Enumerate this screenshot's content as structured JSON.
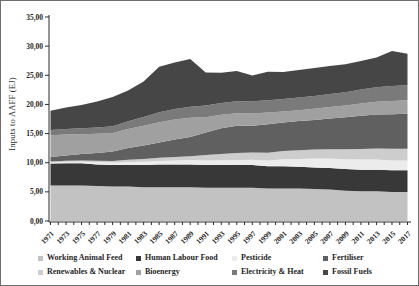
{
  "chart_data": {
    "type": "area",
    "stacked": true,
    "title": "",
    "ylabel": "Inputs to AAFF (EJ)",
    "ylim": [
      0,
      35
    ],
    "ytick_step": 5,
    "ytick_labels": [
      "0,00",
      "5,00",
      "10,00",
      "15,00",
      "20,00",
      "25,00",
      "30,00",
      "35,00"
    ],
    "decimal_style": "comma",
    "grid": false,
    "legend_position": "bottom",
    "x": [
      1971,
      1973,
      1975,
      1977,
      1979,
      1981,
      1983,
      1985,
      1987,
      1989,
      1991,
      1993,
      1995,
      1997,
      1999,
      2001,
      2003,
      2005,
      2007,
      2009,
      2011,
      2013,
      2015,
      2017
    ],
    "x_tick_labels": [
      "1971",
      "1973",
      "1975",
      "1977",
      "1979",
      "1981",
      "1983",
      "1985",
      "1987",
      "1989",
      "1991",
      "1993",
      "1995",
      "1997",
      "1999",
      "2001",
      "2003",
      "2005",
      "2007",
      "2009",
      "2011",
      "2013",
      "2015",
      "2017"
    ],
    "series": [
      {
        "name": "Working Animal Feed",
        "color": "#c2c2c2",
        "values": [
          6.1,
          6.1,
          6.1,
          6.0,
          5.9,
          5.9,
          5.8,
          5.8,
          5.8,
          5.8,
          5.7,
          5.7,
          5.7,
          5.7,
          5.6,
          5.6,
          5.6,
          5.5,
          5.4,
          5.2,
          5.1,
          5.1,
          5.0,
          5.0
        ]
      },
      {
        "name": "Human Labour Food",
        "color": "#383838",
        "values": [
          3.75,
          3.8,
          3.8,
          3.7,
          3.7,
          3.7,
          3.8,
          3.9,
          3.9,
          3.9,
          3.9,
          3.9,
          3.9,
          3.9,
          3.8,
          3.8,
          3.7,
          3.7,
          3.7,
          3.7,
          3.7,
          3.7,
          3.7,
          3.7
        ]
      },
      {
        "name": "Pesticide",
        "color": "#ececec",
        "values": [
          0.2,
          0.25,
          0.3,
          0.4,
          0.45,
          0.5,
          0.55,
          0.6,
          0.7,
          0.75,
          0.8,
          0.82,
          0.85,
          0.9,
          1.0,
          1.2,
          1.35,
          1.5,
          1.6,
          1.7,
          1.75,
          1.75,
          1.7,
          1.7
        ]
      },
      {
        "name": "Renewables & Nuclear",
        "color": "#cdcdcd",
        "values": [
          0.15,
          0.17,
          0.2,
          0.22,
          0.25,
          0.4,
          0.5,
          0.55,
          0.6,
          0.65,
          0.9,
          1.1,
          1.2,
          1.25,
          1.3,
          1.4,
          1.5,
          1.55,
          1.6,
          1.7,
          1.8,
          1.9,
          2.0,
          2.0
        ]
      },
      {
        "name": "Fertiliser",
        "color": "#606060",
        "values": [
          0.8,
          0.9,
          1.1,
          1.35,
          1.6,
          2.0,
          2.3,
          2.6,
          3.0,
          3.3,
          3.9,
          4.4,
          4.7,
          4.6,
          4.9,
          4.9,
          5.0,
          5.1,
          5.3,
          5.5,
          5.7,
          5.8,
          5.9,
          6.0
        ]
      },
      {
        "name": "Bioenergy",
        "color": "#a0a0a0",
        "values": [
          3.7,
          3.6,
          3.4,
          3.3,
          3.2,
          3.3,
          3.4,
          3.5,
          3.4,
          3.3,
          2.6,
          2.3,
          2.15,
          2.1,
          2.0,
          1.9,
          1.85,
          1.9,
          1.95,
          2.0,
          2.1,
          2.2,
          2.3,
          2.3
        ]
      },
      {
        "name": "Electricity & Heat",
        "color": "#7a7a7a",
        "values": [
          0.9,
          0.95,
          1.0,
          1.05,
          1.15,
          1.3,
          1.5,
          1.7,
          1.8,
          1.9,
          2.0,
          2.0,
          2.05,
          2.1,
          2.1,
          2.15,
          2.2,
          2.2,
          2.25,
          2.3,
          2.4,
          2.5,
          2.55,
          2.6
        ]
      },
      {
        "name": "Fossil Fuels",
        "color": "#464646",
        "values": [
          3.3,
          3.7,
          4.0,
          4.5,
          5.0,
          5.3,
          6.1,
          7.8,
          8.0,
          8.2,
          5.7,
          5.2,
          5.2,
          4.4,
          4.9,
          4.6,
          4.7,
          4.8,
          4.8,
          4.8,
          4.9,
          5.1,
          6.0,
          5.4
        ]
      }
    ],
    "legend_display_order": [
      "Working Animal Feed",
      "Human Labour Food",
      "Pesticide",
      "Fertiliser",
      "Renewables & Nuclear",
      "Bioenergy",
      "Electricity & Heat",
      "Fossil Fuels"
    ]
  }
}
